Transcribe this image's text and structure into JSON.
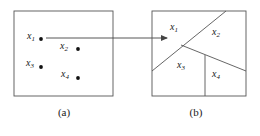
{
  "figure": {
    "background_color": "#ffffff",
    "stroke_color": "#555555",
    "dot_color": "#111111",
    "text_color": "#1a1a1a"
  },
  "panel_a": {
    "caption": "(a)",
    "box": {
      "x": 14,
      "y": 11,
      "width": 99,
      "height": 85
    },
    "points": [
      {
        "id": "x1",
        "label": "x",
        "subscript": "1",
        "label_x": 27,
        "label_y": 32,
        "dot_x": 41,
        "dot_y": 39
      },
      {
        "id": "x2",
        "label": "x",
        "subscript": "2",
        "label_x": 59,
        "label_y": 43,
        "dot_x": 78,
        "dot_y": 49
      },
      {
        "id": "x3",
        "label": "x",
        "subscript": "3",
        "label_x": 25,
        "label_y": 58,
        "dot_x": 41,
        "dot_y": 67
      },
      {
        "id": "x4",
        "label": "x",
        "subscript": "4",
        "label_x": 60,
        "label_y": 68,
        "dot_x": 78,
        "dot_y": 78
      }
    ]
  },
  "arrow": {
    "from_x": 46,
    "from_y": 38,
    "to_x": 168,
    "to_y": 38
  },
  "panel_b": {
    "caption": "(b)",
    "box": {
      "x": 152,
      "y": 11,
      "width": 94,
      "height": 85
    },
    "junction": {
      "x": 181,
      "y": 45
    },
    "partition_lines": [
      {
        "id": "diagonal-main",
        "x1": 226,
        "y1": 11,
        "x2": 152,
        "y2": 71
      },
      {
        "id": "diagonal-right",
        "x1": 181,
        "y1": 45,
        "x2": 246,
        "y2": 71
      },
      {
        "id": "vertical-divider",
        "x1": 205,
        "y1": 55,
        "x2": 205,
        "y2": 96
      }
    ],
    "regions": [
      {
        "id": "x1",
        "label": "x",
        "subscript": "1",
        "label_x": 170,
        "label_y": 25
      },
      {
        "id": "x2",
        "label": "x",
        "subscript": "2",
        "label_x": 212,
        "label_y": 28
      },
      {
        "id": "x3",
        "label": "x",
        "subscript": "3",
        "label_x": 177,
        "label_y": 62
      },
      {
        "id": "x4",
        "label": "x",
        "subscript": "4",
        "label_x": 212,
        "label_y": 70
      }
    ]
  }
}
